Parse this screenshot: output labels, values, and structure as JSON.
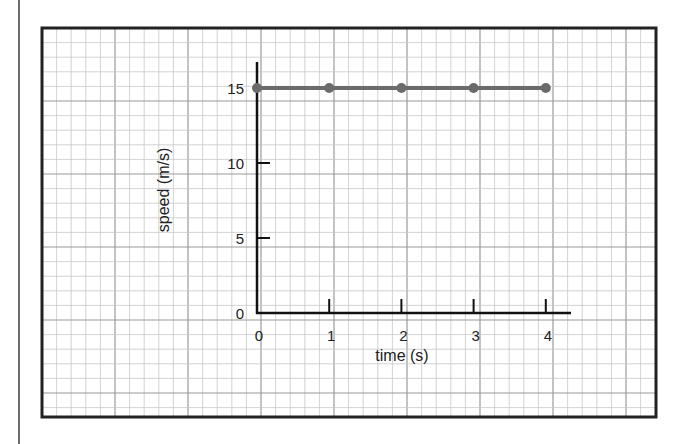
{
  "chart_data": {
    "type": "line",
    "title": "",
    "xlabel": "time (s)",
    "ylabel": "speed (m/s)",
    "x": [
      0,
      1,
      2,
      3,
      4
    ],
    "series": [
      {
        "name": "speed",
        "values": [
          15,
          15,
          15,
          15,
          15
        ],
        "color": "#6b6b6b"
      }
    ],
    "xticks": [
      "0",
      "1",
      "2",
      "3",
      "4"
    ],
    "yticks": [
      "0",
      "5",
      "10",
      "15"
    ],
    "xlim": [
      0,
      4.3
    ],
    "ylim": [
      0,
      16.7
    ],
    "grid": true,
    "legend": null
  },
  "colors": {
    "grid_minor": "#c8c8c8",
    "grid_major": "#9a9a9a",
    "frame": "#222222",
    "axis": "#111111",
    "series": "#6b6b6b"
  }
}
